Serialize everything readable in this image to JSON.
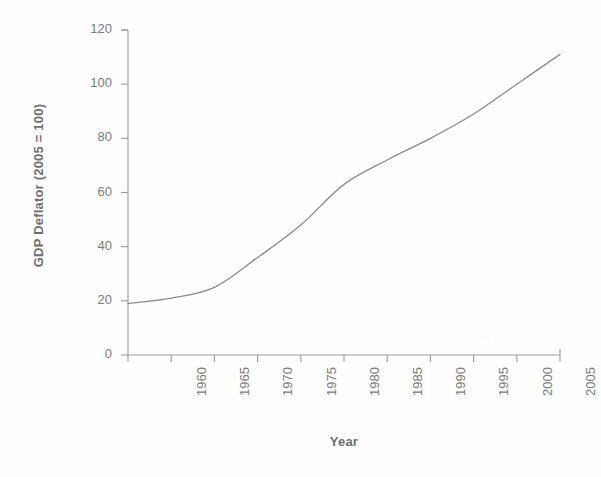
{
  "chart_data": {
    "type": "line",
    "title": "",
    "subtitle": "",
    "xlabel": "Year",
    "ylabel": "GDP Deflator (2005 = 100)",
    "x": [
      1960,
      1965,
      1970,
      1975,
      1980,
      1985,
      1990,
      1995,
      2000,
      2005,
      2010
    ],
    "values": [
      19,
      21,
      25,
      36,
      48,
      63,
      72,
      80,
      89,
      100,
      111
    ],
    "series": [
      {
        "name": "GDP Deflator",
        "values": [
          19,
          21,
          25,
          36,
          48,
          63,
          72,
          80,
          89,
          100,
          111
        ]
      }
    ],
    "xlim": [
      1960,
      2010
    ],
    "ylim": [
      0,
      120
    ],
    "xticks": [
      1960,
      1965,
      1970,
      1975,
      1980,
      1985,
      1990,
      1995,
      2000,
      2005,
      2010
    ],
    "yticks": [
      0,
      20,
      40,
      60,
      80,
      100,
      120
    ],
    "xtick_labels": [
      "1960",
      "1965",
      "1970",
      "1975",
      "1980",
      "1985",
      "1990",
      "1995",
      "2000",
      "2005",
      "2010"
    ],
    "ytick_labels": [
      "0",
      "20",
      "40",
      "60",
      "80",
      "100",
      "120"
    ],
    "xtick_rotation": 90,
    "grid": false,
    "legend": false,
    "legend_position": "none",
    "line_color": "#8a8a8a",
    "axis_color": "#9a9a9a",
    "text_color": "#6e6e6e",
    "background_color": "#fefefe"
  },
  "axes": {
    "x_title": "Year",
    "y_title": "GDP Deflator (2005 = 100)"
  }
}
